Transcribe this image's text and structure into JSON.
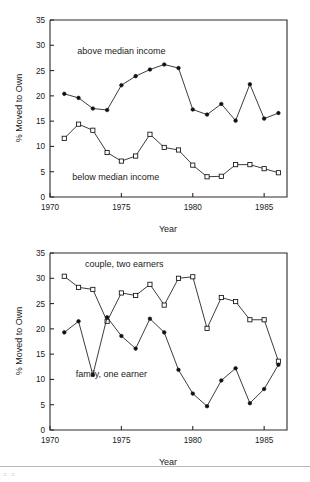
{
  "figure": {
    "background_color": "#ffffff",
    "line_color": "#1a1a1a",
    "axis_color": "#2b2b2b"
  },
  "footer": {
    "rule_color": "#b9b9b9",
    "artifact_text": "= ="
  },
  "chart_data": [
    {
      "type": "line",
      "title": "",
      "xlabel": "Year",
      "ylabel": "% Moved to Own",
      "xlim": [
        1970,
        1986.6
      ],
      "ylim": [
        0,
        35
      ],
      "xticks": [
        1970,
        1975,
        1980,
        1985
      ],
      "xticklabels": [
        "1970",
        "1975",
        "1980",
        "1985"
      ],
      "yticks": [
        0,
        5,
        10,
        15,
        20,
        25,
        30,
        35
      ],
      "yticklabels": [
        "0",
        "5",
        "10",
        "15",
        "20",
        "25",
        "30",
        "35"
      ],
      "grid": false,
      "legend": "inline-annotations",
      "x": [
        1971,
        1972,
        1973,
        1974,
        1975,
        1976,
        1977,
        1978,
        1979,
        1980,
        1981,
        1982,
        1983,
        1984,
        1985,
        1986
      ],
      "series": [
        {
          "name": "above median income",
          "marker": "filled-circle",
          "label_x": 1975.0,
          "label_y": 28.2,
          "values": [
            20.4,
            19.6,
            17.5,
            17.2,
            22.1,
            23.9,
            25.2,
            26.2,
            25.5,
            17.3,
            16.3,
            18.4,
            15.1,
            22.3,
            15.5,
            16.6
          ]
        },
        {
          "name": "below median income",
          "marker": "open-square",
          "label_x": 1974.6,
          "label_y": 3.4,
          "values": [
            11.6,
            14.4,
            13.2,
            8.8,
            7.1,
            8.1,
            12.4,
            9.8,
            9.3,
            6.3,
            4.0,
            4.1,
            6.4,
            6.4,
            5.6,
            4.8
          ]
        }
      ]
    },
    {
      "type": "line",
      "title": "",
      "xlabel": "Year",
      "ylabel": "% Moved to Own",
      "xlim": [
        1970,
        1986.6
      ],
      "ylim": [
        0,
        35
      ],
      "xticks": [
        1970,
        1975,
        1980,
        1985
      ],
      "xticklabels": [
        "1970",
        "1975",
        "1980",
        "1985"
      ],
      "yticks": [
        0,
        5,
        10,
        15,
        20,
        25,
        30,
        35
      ],
      "yticklabels": [
        "0",
        "5",
        "10",
        "15",
        "20",
        "25",
        "30",
        "35"
      ],
      "grid": false,
      "legend": "inline-annotations",
      "x": [
        1971,
        1972,
        1973,
        1974,
        1975,
        1976,
        1977,
        1978,
        1979,
        1980,
        1981,
        1982,
        1983,
        1984,
        1985,
        1986
      ],
      "series": [
        {
          "name": "couple, two earners",
          "marker": "open-square",
          "label_x": 1975.2,
          "label_y": 32.2,
          "values": [
            30.4,
            28.2,
            27.8,
            21.5,
            27.1,
            26.6,
            28.8,
            24.7,
            30.0,
            30.3,
            20.1,
            26.2,
            25.4,
            21.8,
            21.8,
            13.6
          ]
        },
        {
          "name": "family, one earner",
          "marker": "filled-circle",
          "label_x": 1974.3,
          "label_y": 10.4,
          "values": [
            19.3,
            21.5,
            10.9,
            22.3,
            18.6,
            16.1,
            22.0,
            19.3,
            11.9,
            7.2,
            4.7,
            9.8,
            12.2,
            5.3,
            8.1,
            12.9
          ]
        }
      ]
    }
  ]
}
